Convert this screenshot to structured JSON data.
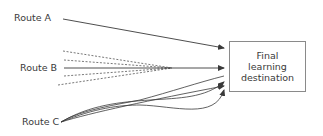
{
  "diagram": {
    "routes": [
      {
        "label": "Route A",
        "style": "single straight line"
      },
      {
        "label": "Route B",
        "style": "solid line with dashed divergent lines"
      },
      {
        "label": "Route C",
        "style": "multiple curved lines"
      }
    ],
    "destination": {
      "lines": [
        "Final",
        "learning",
        "destination"
      ]
    },
    "colors": {
      "line": "#3a3a3a",
      "box_border": "#8a8a8a",
      "text": "#3a3a3a"
    }
  }
}
